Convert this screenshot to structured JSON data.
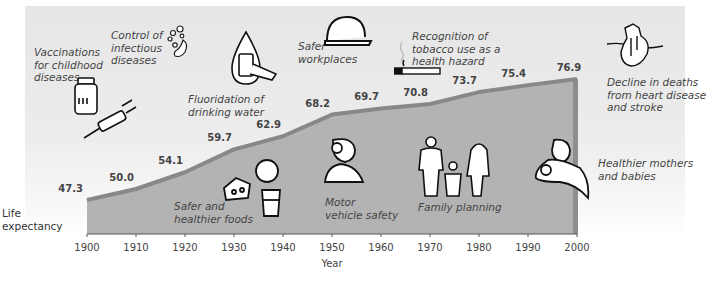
{
  "chart_data": {
    "type": "area",
    "title": "",
    "xlabel": "Year",
    "ylabel": "Life expectancy",
    "x": [
      1900,
      1910,
      1920,
      1930,
      1940,
      1950,
      1960,
      1970,
      1980,
      1990,
      2000
    ],
    "values": [
      47.3,
      50.0,
      54.1,
      59.7,
      62.9,
      68.2,
      69.7,
      70.8,
      73.7,
      75.4,
      76.9
    ],
    "value_labels": [
      "47.3",
      "50.0",
      "54.1",
      "59.7",
      "62.9",
      "68.2",
      "69.7",
      "70.8",
      "73.7",
      "75.4",
      "76.9"
    ],
    "tick_labels": [
      "1900",
      "1910",
      "1920",
      "1930",
      "1940",
      "1950",
      "1960",
      "1970",
      "1980",
      "1990",
      "2000"
    ],
    "xlim": [
      1900,
      2000
    ],
    "ylim": [
      39,
      80
    ],
    "grid": "vertical lines at each decade",
    "fill_color": "#b3b3b3",
    "edge_color": "#888888",
    "annotations": [
      {
        "id": "vaccinations",
        "text": "Vaccinations\nfor childhood\ndiseases",
        "icon": "vaccine-vial-syringe-icon"
      },
      {
        "id": "infectious",
        "text": "Control of\ninfectious\ndiseases",
        "icon": "germ-icon"
      },
      {
        "id": "fluoridation",
        "text": "Fluoridation of\ndrinking water",
        "icon": "water-drop-glass-icon"
      },
      {
        "id": "workplaces",
        "text": "Safer\nworkplaces",
        "icon": "hard-hat-icon"
      },
      {
        "id": "tobacco",
        "text": "Recognition of\ntobacco use as a\nhealth hazard",
        "icon": "cigarette-icon"
      },
      {
        "id": "heart",
        "text": "Decline in deaths\nfrom heart disease\nand stroke",
        "icon": "heart-icon"
      },
      {
        "id": "foods",
        "text": "Safer and\nhealthier foods",
        "icon": "cheese-milk-icon"
      },
      {
        "id": "motor",
        "text": "Motor\nvehicle safety",
        "icon": "crash-dummy-icon"
      },
      {
        "id": "family",
        "text": "Family planning",
        "icon": "family-icon"
      },
      {
        "id": "mothers",
        "text": "Healthier mothers\nand babies",
        "icon": "mother-baby-icon"
      }
    ]
  }
}
